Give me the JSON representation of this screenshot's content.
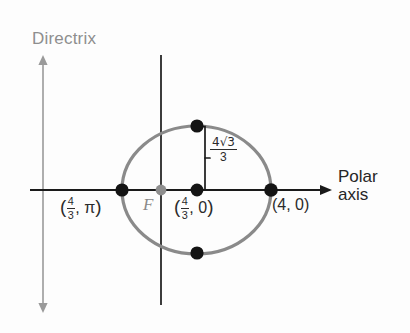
{
  "figure": {
    "type": "polar-conic-diagram",
    "background_color": "#fdfdfd"
  },
  "axes": {
    "polar_axis": {
      "label_line1": "Polar",
      "label_line2": "axis",
      "color": "#1a1a1a",
      "arrow": "right"
    },
    "vertical_axis": {
      "color": "#1a1a1a",
      "arrow": "none"
    },
    "directrix": {
      "label": "Directrix",
      "color": "#9a9a9a",
      "arrow": "both"
    }
  },
  "focus": {
    "label": "F",
    "color": "#8a8a8a"
  },
  "curve": {
    "shape": "ellipse",
    "stroke_color": "#8a8a8a",
    "stroke_width": 3
  },
  "points": {
    "left_vertex": {
      "name": "left-vertex",
      "r_num": "4",
      "r_den": "3",
      "theta": "π",
      "label_open": "(",
      "label_sep": ", ",
      "label_close": ")"
    },
    "focal_chord_point": {
      "name": "focal-chord-point",
      "r_num": "4",
      "r_den": "3",
      "theta": "0",
      "label_open": "(",
      "label_sep": ", ",
      "label_close": ")"
    },
    "right_vertex": {
      "name": "right-vertex",
      "label": "(4, 0)"
    },
    "top_point": {
      "name": "top-point"
    },
    "bottom_point": {
      "name": "bottom-point"
    }
  },
  "measure": {
    "name": "semi-latus-rectum",
    "numerator": "4√3",
    "denominator": "3"
  },
  "colors": {
    "ink": "#1a1a1a",
    "gray": "#8a8a8a",
    "light_gray": "#9a9a9a",
    "text": "#2b2b2b"
  }
}
